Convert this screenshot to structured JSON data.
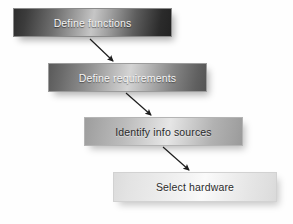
{
  "diagram": {
    "type": "flowchart",
    "orientation": "cascading-top-left-to-bottom-right",
    "title": "",
    "node_count": 4,
    "arrow_count": 3,
    "background_color": "#ffffff",
    "nodes": [
      {
        "id": "node-0",
        "label": "Define functions",
        "order": 1,
        "shade": "darkest",
        "text_color": "#f2f2f2",
        "x": 13,
        "y": 8,
        "width": 159,
        "height": 29
      },
      {
        "id": "node-1",
        "label": "Define requirements",
        "order": 2,
        "shade": "dark",
        "text_color": "#f4f4f4",
        "x": 48,
        "y": 63,
        "width": 159,
        "height": 29
      },
      {
        "id": "node-2",
        "label": "Identify info sources",
        "order": 3,
        "shade": "medium",
        "text_color": "#2a2a2a",
        "x": 84,
        "y": 117,
        "width": 159,
        "height": 29
      },
      {
        "id": "node-3",
        "label": "Select hardware",
        "order": 4,
        "shade": "lightest",
        "text_color": "#2b2b2b",
        "x": 113,
        "y": 172,
        "width": 164,
        "height": 30
      }
    ],
    "arrows": [
      {
        "id": "arrow-0",
        "from": "node-0",
        "to": "node-1",
        "color": "#1d1d1d",
        "x1": 90,
        "y1": 39,
        "x2": 113,
        "y2": 61
      },
      {
        "id": "arrow-1",
        "from": "node-1",
        "to": "node-2",
        "color": "#1d1d1d",
        "x1": 126,
        "y1": 93,
        "x2": 151,
        "y2": 115
      },
      {
        "id": "arrow-2",
        "from": "node-2",
        "to": "node-3",
        "color": "#1d1d1d",
        "x1": 163,
        "y1": 147,
        "x2": 189,
        "y2": 170
      }
    ]
  }
}
